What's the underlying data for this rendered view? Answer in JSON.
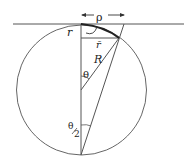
{
  "diagram": {
    "labels": {
      "rho": "ρ",
      "r": "r",
      "r_bar": "r̄",
      "R": "R",
      "theta": "θ",
      "theta_half_num": "θ",
      "theta_half_den": "2"
    },
    "colors": {
      "stroke": "#555555",
      "text": "#222222"
    }
  }
}
